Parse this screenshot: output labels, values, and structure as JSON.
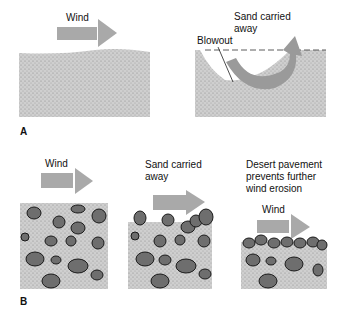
{
  "panel_a": {
    "letter": "A",
    "left": {
      "wind_label": "Wind"
    },
    "right": {
      "sand_label_line1": "Sand carried",
      "sand_label_line2": "away",
      "blowout_label": "Blowout"
    }
  },
  "panel_b": {
    "letter": "B",
    "stage1": {
      "wind_label": "Wind"
    },
    "stage2": {
      "sand_label_line1": "Sand carried",
      "sand_label_line2": "away"
    },
    "stage3": {
      "pavement_line1": "Desert pavement",
      "pavement_line2": "prevents further",
      "pavement_line3": "wind erosion",
      "wind_label": "Wind"
    }
  },
  "colors": {
    "sand": "#c9c9c9",
    "arrow": "#a9a9a9",
    "pebble": "#6e6e6e",
    "pebble_outline": "#1a1a1a"
  }
}
